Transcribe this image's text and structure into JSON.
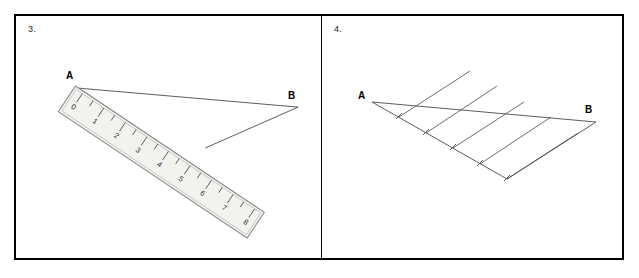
{
  "figure": {
    "background": "#ffffff",
    "frame_color": "#000000",
    "line_color": "#4a4a4a",
    "ruler_outline": "#8a8a8a",
    "ruler_fill": "#f2f2ee"
  },
  "panels": [
    {
      "id": "panel-3",
      "label": "3.",
      "points": [
        {
          "name": "A",
          "label": "A"
        },
        {
          "name": "B",
          "label": "B"
        }
      ],
      "ruler": {
        "tick_labels": [
          "0",
          "1",
          "2",
          "3",
          "4",
          "5",
          "6",
          "7",
          "8"
        ],
        "orientation": "diagonal-down-right"
      }
    },
    {
      "id": "panel-4",
      "label": "4.",
      "points": [
        {
          "name": "A",
          "label": "A"
        },
        {
          "name": "B",
          "label": "B"
        }
      ],
      "parallel_line_count": 5,
      "division_tick_count": 5
    }
  ]
}
